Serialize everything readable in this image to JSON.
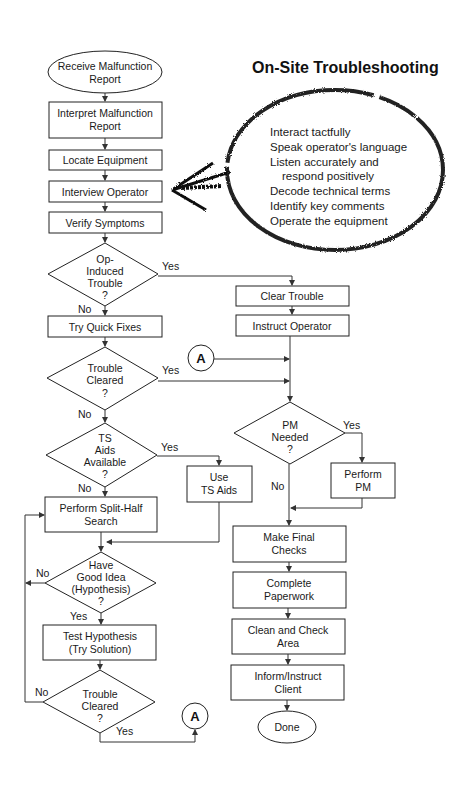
{
  "title": "On-Site Troubleshooting",
  "nodes": {
    "receive": [
      "Receive Malfunction",
      "Report"
    ],
    "interpret": [
      "Interpret Malfunction",
      "Report"
    ],
    "locate": [
      "Locate Equipment"
    ],
    "interview": [
      "Interview Operator"
    ],
    "verify": [
      "Verify Symptoms"
    ],
    "op_induced": [
      "Op-",
      "Induced",
      "Trouble",
      "?"
    ],
    "quick_fixes": [
      "Try Quick Fixes"
    ],
    "cleared1": [
      "Trouble",
      "Cleared",
      "?"
    ],
    "ts_aids": [
      "TS",
      "Aids",
      "Available",
      "?"
    ],
    "use_ts": [
      "Use",
      "TS Aids"
    ],
    "split_half": [
      "Perform Split-Half",
      "Search"
    ],
    "good_idea": [
      "Have",
      "Good Idea",
      "(Hypothesis)",
      "?"
    ],
    "test_hyp": [
      "Test Hypothesis",
      "(Try Solution)"
    ],
    "cleared2": [
      "Trouble",
      "Cleared",
      "?"
    ],
    "clear_trouble": [
      "Clear Trouble"
    ],
    "instruct_op": [
      "Instruct Operator"
    ],
    "pm_needed": [
      "PM",
      "Needed",
      "?"
    ],
    "perform_pm": [
      "Perform",
      "PM"
    ],
    "final_checks": [
      "Make Final",
      "Checks"
    ],
    "paperwork": [
      "Complete",
      "Paperwork"
    ],
    "clean": [
      "Clean and Check",
      "Area"
    ],
    "inform": [
      "Inform/Instruct",
      "Client"
    ],
    "done": [
      "Done"
    ]
  },
  "edge_labels": {
    "yes": "Yes",
    "no": "No"
  },
  "connector": "A",
  "callout": {
    "items": [
      "Interact tactfully",
      "Speak operator's language",
      "Listen accurately and",
      "   respond positively",
      "Decode technical terms",
      "Identify key comments",
      "Operate the equipment"
    ]
  }
}
